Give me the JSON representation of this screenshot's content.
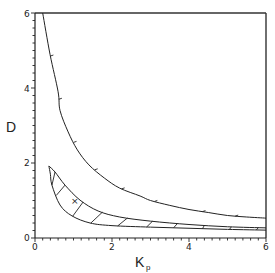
{
  "chart_data": {
    "type": "line",
    "title": "",
    "xlabel": "K",
    "xlabel_subscript": "p",
    "ylabel": "D",
    "xlim": [
      0,
      6
    ],
    "ylim": [
      0,
      6
    ],
    "x_ticks": [
      "0",
      "2",
      "4",
      "6"
    ],
    "y_ticks": [
      "0",
      "2",
      "4",
      "6"
    ],
    "grid": false,
    "legend": null,
    "series": [
      {
        "name": "upper-boundary-curve",
        "points": [
          [
            0.2,
            6.0
          ],
          [
            0.39,
            4.9
          ],
          [
            0.6,
            3.9
          ],
          [
            0.65,
            3.4
          ],
          [
            0.86,
            2.83
          ],
          [
            1.1,
            2.35
          ],
          [
            1.4,
            1.95
          ],
          [
            1.8,
            1.6
          ],
          [
            2.2,
            1.33
          ],
          [
            2.73,
            1.12
          ],
          [
            3.0,
            1.0
          ],
          [
            3.5,
            0.87
          ],
          [
            4.0,
            0.76
          ],
          [
            4.5,
            0.68
          ],
          [
            5.0,
            0.6
          ],
          [
            5.5,
            0.56
          ],
          [
            6.0,
            0.53
          ]
        ]
      },
      {
        "name": "stable-region-upper-edge",
        "points": [
          [
            0.36,
            1.92
          ],
          [
            0.52,
            1.76
          ],
          [
            0.78,
            1.41
          ],
          [
            1.17,
            1.01
          ],
          [
            1.64,
            0.72
          ],
          [
            2.2,
            0.56
          ],
          [
            3.0,
            0.45
          ],
          [
            4.0,
            0.36
          ],
          [
            5.0,
            0.3
          ],
          [
            6.0,
            0.27
          ]
        ]
      },
      {
        "name": "stable-region-lower-edge",
        "points": [
          [
            0.36,
            1.92
          ],
          [
            0.4,
            1.7
          ],
          [
            0.44,
            1.41
          ],
          [
            0.65,
            0.88
          ],
          [
            0.96,
            0.59
          ],
          [
            1.43,
            0.4
          ],
          [
            2.0,
            0.33
          ],
          [
            3.0,
            0.29
          ],
          [
            4.0,
            0.26
          ],
          [
            5.0,
            0.23
          ],
          [
            6.0,
            0.21
          ]
        ]
      }
    ],
    "annotations": [
      {
        "type": "marker",
        "symbol": "×",
        "x": 1.0,
        "y": 1.0
      },
      {
        "type": "hatched-region",
        "between": [
          "stable-region-upper-edge",
          "stable-region-lower-edge"
        ]
      }
    ]
  },
  "labels": {
    "ylabel": "D",
    "xlabel": "K",
    "xlabel_sub": "p",
    "marker": "×",
    "x_ticks": [
      "0",
      "2",
      "4",
      "6"
    ],
    "y_ticks": [
      "0",
      "2",
      "4",
      "6"
    ]
  }
}
